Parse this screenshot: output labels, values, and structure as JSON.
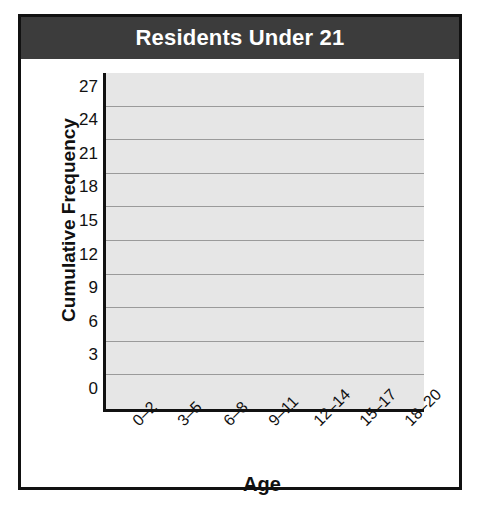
{
  "chart_data": {
    "type": "bar",
    "title": "Residents Under 21",
    "xlabel": "Age",
    "ylabel": "Cumulative Frequency",
    "categories": [
      "0–2",
      "3–5",
      "6–8",
      "9–11",
      "12–14",
      "15–17",
      "18–20"
    ],
    "values": [
      6,
      13,
      18,
      21,
      25,
      27,
      30
    ],
    "yticks": [
      0,
      3,
      6,
      9,
      12,
      15,
      18,
      21,
      24,
      27
    ],
    "ylim": [
      0,
      30
    ],
    "grid": true,
    "legend": "none",
    "bar_colors": [
      "#6e6e6e",
      "#959595",
      "#b0b0b0",
      "#6b6b6b",
      "#5a5a5a",
      "#dcdcdc",
      "#9c9c9c"
    ],
    "plot_background": "#e6e6e6",
    "gridline_color": "#9a9a9a",
    "axis_color": "#111111",
    "title_background": "#3c3c3c",
    "title_color": "#ffffff"
  }
}
